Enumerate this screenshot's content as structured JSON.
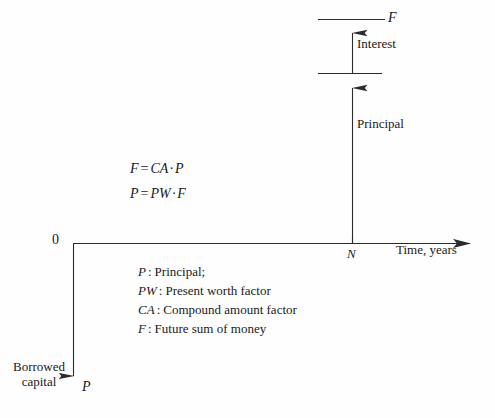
{
  "figure": {
    "type": "cash-flow-diagram",
    "background_color": "#fefefe",
    "line_color": "#2b2b2b"
  },
  "axes": {
    "origin_label": "0",
    "x_axis_label": "Time, years",
    "x_tick_label": "N"
  },
  "cash_flow": {
    "future_sum_label": "F",
    "interest_label": "Interest",
    "principal_label": "Principal"
  },
  "borrowed": {
    "caption": "Borrowed capital",
    "symbol": "P"
  },
  "equations": [
    {
      "lhs": "F",
      "op": "=",
      "rhs_a": "CA",
      "dot": "·",
      "rhs_b": "P"
    },
    {
      "lhs": "P",
      "op": "=",
      "rhs_a": "PW",
      "dot": "·",
      "rhs_b": "F"
    }
  ],
  "legend": [
    {
      "symbol": "P",
      "separator": ":",
      "definition": "Principal;"
    },
    {
      "symbol": "PW",
      "separator": ":",
      "definition": "Present worth factor"
    },
    {
      "symbol": "CA",
      "separator": ":",
      "definition": "Compound amount factor"
    },
    {
      "symbol": "F",
      "separator": ":",
      "definition": "Future sum of money"
    }
  ]
}
